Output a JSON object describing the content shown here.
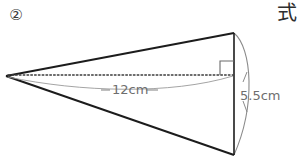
{
  "page": {
    "background_color": "#ffffff",
    "width": 303,
    "height": 160
  },
  "labels": {
    "problem_number": "②",
    "corner_kanji": "式",
    "slant_or_height_label": "12cm",
    "radius_label": "5.5cm"
  },
  "figure": {
    "name": "cone-diagram",
    "colors": {
      "outline": "#1c1c1c",
      "thin_line": "#8a8a8a",
      "dotted_axis": "#3c3c3c",
      "text": "#6e6e6e"
    },
    "geometry": {
      "apex": {
        "x": 6,
        "y": 76
      },
      "base_top": {
        "x": 234,
        "y": 33
      },
      "base_bottom": {
        "x": 234,
        "y": 155
      },
      "base_center": {
        "x": 234,
        "y": 75
      },
      "arc_bulge_x": 256,
      "right_angle_mark": {
        "x": 220,
        "y": 61,
        "size": 14
      }
    },
    "measurements": [
      {
        "name": "axis-length",
        "value": "12cm",
        "along": "apex-to-base-center"
      },
      {
        "name": "base-radius",
        "value": "5.5cm",
        "along": "base-center-to-base-bottom"
      }
    ]
  }
}
